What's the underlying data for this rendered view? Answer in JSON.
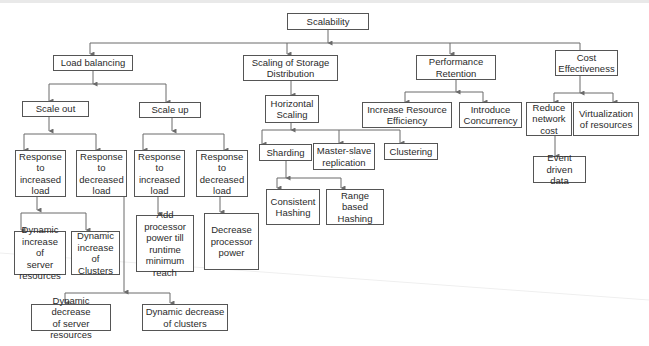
{
  "diagram": {
    "root": "Scalability",
    "nodes": {
      "scalability": "Scalability",
      "load_balancing": "Load balancing",
      "scaling_storage": "Scaling of Storage\nDistribution",
      "performance_retention": "Performance\nRetention",
      "cost_effectiveness": "Cost\nEffectiveness",
      "scale_out": "Scale out",
      "scale_up": "Scale up",
      "horizontal_scaling": "Horizontal\nScaling",
      "increase_resource_efficiency": "Increase Resource\nEfficiency",
      "introduce_concurrency": "Introduce\nConcurrency",
      "reduce_network_cost": "Reduce\nnetwork\ncost",
      "virtualization": "Virtualization\nof resources",
      "out_resp_increased": "Response\nto increased\nload",
      "out_resp_decreased": "Response\nto decreased\nload",
      "up_resp_increased": "Response\nto increased\nload",
      "up_resp_decreased": "Response\nto decreased\nload",
      "sharding": "Sharding",
      "master_slave": "Master-slave\nreplication",
      "clustering": "Clustering",
      "event_driven": "Event driven\ndata",
      "dyn_inc_server": "Dynamic\nincrease of\nserver\nresources",
      "dyn_inc_clusters": "Dynamic\nincrease of\nClusters",
      "add_processor": "Add processor\npower till\nruntime\nminimum\nreach",
      "decrease_processor": "Decrease\nprocessor\npower",
      "consistent_hashing": "Consistent\nHashing",
      "range_hashing": "Range based\nHashing",
      "dyn_dec_server": "Dynamic decrease\nof server resources",
      "dyn_dec_clusters": "Dynamic decrease\nof clusters"
    },
    "edges": [
      [
        "scalability",
        "load_balancing"
      ],
      [
        "scalability",
        "scaling_storage"
      ],
      [
        "scalability",
        "performance_retention"
      ],
      [
        "scalability",
        "cost_effectiveness"
      ],
      [
        "load_balancing",
        "scale_out"
      ],
      [
        "load_balancing",
        "scale_up"
      ],
      [
        "scaling_storage",
        "horizontal_scaling"
      ],
      [
        "performance_retention",
        "increase_resource_efficiency"
      ],
      [
        "performance_retention",
        "introduce_concurrency"
      ],
      [
        "cost_effectiveness",
        "reduce_network_cost"
      ],
      [
        "cost_effectiveness",
        "virtualization"
      ],
      [
        "scale_out",
        "out_resp_increased"
      ],
      [
        "scale_out",
        "out_resp_decreased"
      ],
      [
        "scale_up",
        "up_resp_increased"
      ],
      [
        "scale_up",
        "up_resp_decreased"
      ],
      [
        "horizontal_scaling",
        "sharding"
      ],
      [
        "horizontal_scaling",
        "master_slave"
      ],
      [
        "horizontal_scaling",
        "clustering"
      ],
      [
        "reduce_network_cost",
        "event_driven"
      ],
      [
        "out_resp_increased",
        "dyn_inc_server"
      ],
      [
        "out_resp_increased",
        "dyn_inc_clusters"
      ],
      [
        "up_resp_increased",
        "add_processor"
      ],
      [
        "up_resp_decreased",
        "decrease_processor"
      ],
      [
        "sharding",
        "consistent_hashing"
      ],
      [
        "sharding",
        "range_hashing"
      ],
      [
        "out_resp_decreased",
        "dyn_dec_server"
      ],
      [
        "out_resp_decreased",
        "dyn_dec_clusters"
      ]
    ]
  },
  "style": {
    "line_color": "#6b6b6b",
    "border_color": "#555555"
  }
}
